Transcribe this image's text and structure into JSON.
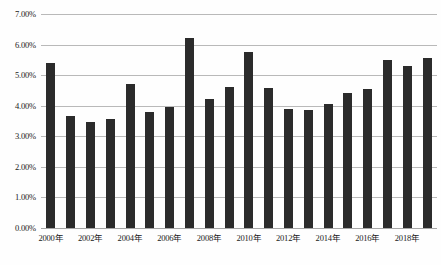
{
  "chart_data": {
    "type": "bar",
    "title": "",
    "subtitle": "",
    "xlabel": "",
    "ylabel": "",
    "grid": true,
    "legend": null,
    "ylim": [
      0,
      7
    ],
    "ytick_labels": [
      "0.00%",
      "1.00%",
      "2.00%",
      "3.00%",
      "4.00%",
      "5.00%",
      "6.00%",
      "7.00%"
    ],
    "ytick_values": [
      0,
      1,
      2,
      3,
      4,
      5,
      6,
      7
    ],
    "categories": [
      "2000年",
      "2001年",
      "2002年",
      "2003年",
      "2004年",
      "2005年",
      "2006年",
      "2007年",
      "2008年",
      "2009年",
      "2010年",
      "2011年",
      "2012年",
      "2013年",
      "2014年",
      "2015年",
      "2016年",
      "2017年",
      "2018年",
      "2019年"
    ],
    "xtick_labels": [
      "2000年",
      "2002年",
      "2004年",
      "2006年",
      "2008年",
      "2010年",
      "2012年",
      "2014年",
      "2016年",
      "2018年"
    ],
    "xtick_indices": [
      0,
      2,
      4,
      6,
      8,
      10,
      12,
      14,
      16,
      18
    ],
    "values": [
      5.4,
      3.68,
      3.48,
      3.58,
      4.7,
      3.8,
      3.95,
      6.2,
      4.22,
      4.62,
      5.75,
      4.58,
      3.88,
      3.85,
      4.05,
      4.42,
      4.55,
      5.48,
      5.3,
      5.55
    ],
    "bar_color": "#2b2b2b",
    "grid_color": "#b9b9b9",
    "background_color": "#ffffff"
  }
}
